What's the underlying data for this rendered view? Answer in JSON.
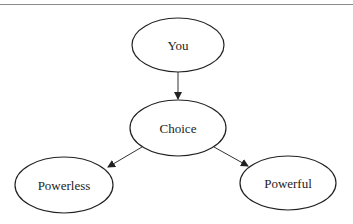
{
  "diagram": {
    "type": "flowchart",
    "nodes": [
      {
        "id": "you",
        "label": "You",
        "cx": 178,
        "cy": 45,
        "rx": 46,
        "ry": 27
      },
      {
        "id": "choice",
        "label": "Choice",
        "cx": 178,
        "cy": 128,
        "rx": 48,
        "ry": 28
      },
      {
        "id": "powerless",
        "label": "Powerless",
        "cx": 64,
        "cy": 185,
        "rx": 49,
        "ry": 28
      },
      {
        "id": "powerful",
        "label": "Powerful",
        "cx": 288,
        "cy": 183,
        "rx": 48,
        "ry": 27
      }
    ],
    "edges": [
      {
        "from": "you",
        "to": "choice"
      },
      {
        "from": "choice",
        "to": "powerless"
      },
      {
        "from": "choice",
        "to": "powerful"
      }
    ],
    "colors": {
      "stroke": "#222222",
      "text": "#222222",
      "background": "#ffffff"
    }
  }
}
